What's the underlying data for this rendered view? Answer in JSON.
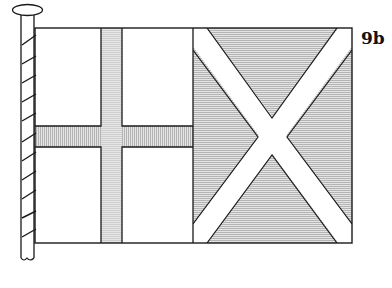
{
  "figure": {
    "label": "9b",
    "colors": {
      "outline": "#1a1a1a",
      "shade": "#d9d9d9",
      "white": "#ffffff"
    }
  }
}
